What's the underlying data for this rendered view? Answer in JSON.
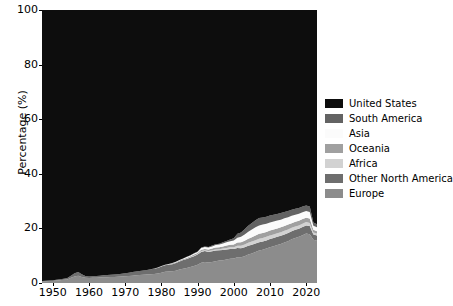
{
  "figure": {
    "background_color": "#ffffff",
    "text_color": "#000000"
  },
  "axes": {
    "ylabel": "Percentage (%)",
    "xlabel": "",
    "yticks": [
      "0",
      "20",
      "40",
      "60",
      "80",
      "100"
    ],
    "xticks": [
      "1950",
      "1960",
      "1970",
      "1980",
      "1990",
      "2000",
      "2010",
      "2020"
    ]
  },
  "legend": {
    "position": "right",
    "items": [
      {
        "label": "United States",
        "color": "#0d0d0d"
      },
      {
        "label": "South America",
        "color": "#636363"
      },
      {
        "label": "Asia",
        "color": "#fbfbfb"
      },
      {
        "label": "Oceania",
        "color": "#a0a0a0"
      },
      {
        "label": "Africa",
        "color": "#d2d2d2"
      },
      {
        "label": "Other North America",
        "color": "#6e6e6e"
      },
      {
        "label": "Europe",
        "color": "#8c8c8c"
      }
    ]
  },
  "chart_data": {
    "type": "area",
    "stacked": true,
    "title": "",
    "xlabel": "",
    "ylabel": "Percentage (%)",
    "xlim": [
      1947,
      2023
    ],
    "ylim": [
      0,
      100
    ],
    "grid": false,
    "legend_position": "right",
    "stack_order_bottom_to_top": [
      "Europe",
      "Other North America",
      "Africa",
      "Oceania",
      "Asia",
      "South America",
      "United States"
    ],
    "x": [
      1947,
      1948,
      1949,
      1950,
      1951,
      1952,
      1953,
      1954,
      1955,
      1956,
      1957,
      1958,
      1959,
      1960,
      1961,
      1962,
      1963,
      1964,
      1965,
      1966,
      1967,
      1968,
      1969,
      1970,
      1971,
      1972,
      1973,
      1974,
      1975,
      1976,
      1977,
      1978,
      1979,
      1980,
      1981,
      1982,
      1983,
      1984,
      1985,
      1986,
      1987,
      1988,
      1989,
      1990,
      1991,
      1992,
      1993,
      1994,
      1995,
      1996,
      1997,
      1998,
      1999,
      2000,
      2001,
      2002,
      2003,
      2004,
      2005,
      2006,
      2007,
      2008,
      2009,
      2010,
      2011,
      2012,
      2013,
      2014,
      2015,
      2016,
      2017,
      2018,
      2019,
      2020,
      2021,
      2022,
      2023
    ],
    "series": [
      {
        "name": "United States",
        "color": "#0d0d0d",
        "values": [
          99.3,
          99.2,
          99.1,
          99.0,
          98.8,
          98.6,
          98.4,
          98.2,
          97.3,
          96.4,
          96.0,
          96.8,
          97.4,
          97.6,
          97.5,
          97.4,
          97.3,
          97.2,
          97.1,
          97.0,
          96.9,
          96.8,
          96.6,
          96.4,
          96.2,
          96.0,
          95.8,
          95.6,
          95.4,
          95.2,
          95.0,
          94.7,
          94.3,
          93.8,
          93.3,
          93.0,
          92.7,
          92.2,
          91.6,
          91.0,
          90.4,
          89.8,
          89.1,
          88.5,
          87.0,
          86.6,
          86.8,
          86.3,
          85.8,
          85.6,
          85.1,
          84.6,
          84.1,
          83.6,
          82.0,
          81.5,
          80.3,
          79.0,
          78.0,
          77.0,
          76.2,
          76.0,
          75.7,
          75.3,
          75.0,
          74.7,
          74.4,
          74.0,
          73.6,
          73.2,
          72.8,
          72.5,
          72.0,
          71.6,
          72.0,
          77.8,
          78.5
        ]
      },
      {
        "name": "South America",
        "color": "#636363",
        "values": [
          0.0,
          0.0,
          0.0,
          0.0,
          0.0,
          0.0,
          0.0,
          0.0,
          0.0,
          0.0,
          0.0,
          0.0,
          0.0,
          0.0,
          0.0,
          0.0,
          0.0,
          0.0,
          0.0,
          0.0,
          0.0,
          0.0,
          0.0,
          0.0,
          0.0,
          0.0,
          0.0,
          0.0,
          0.0,
          0.0,
          0.0,
          0.0,
          0.0,
          0.0,
          0.0,
          0.0,
          0.0,
          0.0,
          0.0,
          0.0,
          0.1,
          0.1,
          0.1,
          0.1,
          0.2,
          0.2,
          0.2,
          0.3,
          0.3,
          0.3,
          0.4,
          0.5,
          0.6,
          0.8,
          1.4,
          1.6,
          1.9,
          2.2,
          2.4,
          2.6,
          2.7,
          2.6,
          2.6,
          2.5,
          2.5,
          2.4,
          2.4,
          2.3,
          2.3,
          2.2,
          2.2,
          2.1,
          2.1,
          2.0,
          2.0,
          1.2,
          1.1
        ]
      },
      {
        "name": "Asia",
        "color": "#fbfbfb",
        "values": [
          0.0,
          0.0,
          0.0,
          0.0,
          0.0,
          0.0,
          0.0,
          0.0,
          0.0,
          0.0,
          0.0,
          0.0,
          0.0,
          0.0,
          0.0,
          0.0,
          0.0,
          0.0,
          0.0,
          0.0,
          0.0,
          0.0,
          0.0,
          0.0,
          0.0,
          0.0,
          0.0,
          0.0,
          0.0,
          0.0,
          0.0,
          0.0,
          0.1,
          0.1,
          0.1,
          0.1,
          0.1,
          0.2,
          0.2,
          0.2,
          0.3,
          0.3,
          0.4,
          0.4,
          0.6,
          0.7,
          0.7,
          0.8,
          0.9,
          1.0,
          1.1,
          1.2,
          1.3,
          1.5,
          1.8,
          2.0,
          2.3,
          2.6,
          2.8,
          3.0,
          3.1,
          3.1,
          3.0,
          3.0,
          2.9,
          2.9,
          2.8,
          2.8,
          2.7,
          2.7,
          2.6,
          2.6,
          2.5,
          2.5,
          2.4,
          1.5,
          1.4
        ]
      },
      {
        "name": "Oceania",
        "color": "#a0a0a0",
        "values": [
          0.0,
          0.0,
          0.0,
          0.0,
          0.0,
          0.0,
          0.0,
          0.0,
          0.0,
          0.0,
          0.0,
          0.0,
          0.0,
          0.0,
          0.0,
          0.0,
          0.0,
          0.0,
          0.0,
          0.0,
          0.0,
          0.0,
          0.0,
          0.0,
          0.0,
          0.0,
          0.0,
          0.0,
          0.0,
          0.0,
          0.0,
          0.1,
          0.1,
          0.1,
          0.1,
          0.1,
          0.2,
          0.2,
          0.2,
          0.3,
          0.3,
          0.3,
          0.4,
          0.4,
          0.5,
          0.5,
          0.6,
          0.6,
          0.7,
          0.7,
          0.8,
          0.9,
          0.9,
          1.0,
          1.2,
          1.3,
          1.4,
          1.5,
          1.6,
          1.7,
          1.8,
          1.8,
          1.8,
          1.8,
          1.8,
          1.8,
          1.8,
          1.8,
          1.8,
          1.7,
          1.7,
          1.7,
          1.7,
          1.6,
          1.6,
          1.0,
          0.9
        ]
      },
      {
        "name": "Africa",
        "color": "#d2d2d2",
        "values": [
          0.0,
          0.0,
          0.0,
          0.0,
          0.0,
          0.0,
          0.0,
          0.0,
          0.0,
          0.0,
          0.0,
          0.0,
          0.0,
          0.0,
          0.0,
          0.0,
          0.0,
          0.0,
          0.0,
          0.0,
          0.0,
          0.0,
          0.0,
          0.0,
          0.0,
          0.0,
          0.0,
          0.0,
          0.0,
          0.0,
          0.0,
          0.0,
          0.0,
          0.0,
          0.0,
          0.1,
          0.1,
          0.1,
          0.1,
          0.1,
          0.1,
          0.2,
          0.2,
          0.2,
          0.3,
          0.3,
          0.3,
          0.4,
          0.4,
          0.4,
          0.5,
          0.5,
          0.6,
          0.6,
          0.8,
          0.9,
          1.0,
          1.1,
          1.2,
          1.2,
          1.3,
          1.3,
          1.3,
          1.3,
          1.3,
          1.3,
          1.3,
          1.3,
          1.3,
          1.2,
          1.2,
          1.2,
          1.2,
          1.2,
          1.1,
          0.7,
          0.7
        ]
      },
      {
        "name": "Other North America",
        "color": "#6e6e6e",
        "values": [
          0.2,
          0.2,
          0.2,
          0.3,
          0.3,
          0.4,
          0.4,
          0.5,
          0.8,
          1.2,
          1.3,
          1.0,
          0.7,
          0.6,
          0.6,
          0.7,
          0.7,
          0.7,
          0.8,
          0.8,
          0.9,
          0.9,
          1.0,
          1.1,
          1.2,
          1.3,
          1.4,
          1.5,
          1.6,
          1.7,
          1.8,
          1.9,
          2.0,
          2.2,
          2.4,
          2.5,
          2.6,
          2.8,
          3.0,
          3.2,
          3.3,
          3.4,
          3.6,
          3.7,
          4.0,
          4.0,
          3.9,
          3.9,
          3.9,
          3.8,
          3.8,
          3.7,
          3.6,
          3.5,
          3.4,
          3.3,
          3.3,
          3.2,
          3.2,
          3.1,
          3.0,
          3.0,
          3.0,
          3.0,
          3.0,
          3.0,
          3.0,
          3.0,
          3.0,
          3.0,
          3.0,
          3.0,
          3.0,
          3.0,
          3.0,
          2.0,
          1.9
        ]
      },
      {
        "name": "Europe",
        "color": "#8c8c8c",
        "values": [
          0.5,
          0.6,
          0.7,
          0.7,
          0.9,
          1.0,
          1.2,
          1.3,
          1.9,
          2.4,
          2.7,
          2.2,
          1.9,
          1.8,
          1.9,
          1.9,
          2.0,
          2.1,
          2.1,
          2.2,
          2.2,
          2.3,
          2.4,
          2.5,
          2.6,
          2.7,
          2.8,
          2.9,
          3.0,
          3.1,
          3.2,
          3.3,
          3.5,
          3.8,
          4.1,
          4.2,
          4.3,
          4.5,
          4.9,
          5.2,
          5.5,
          5.9,
          6.2,
          6.7,
          7.4,
          7.7,
          7.5,
          7.7,
          8.0,
          8.2,
          8.3,
          8.6,
          8.9,
          9.0,
          9.4,
          9.4,
          9.8,
          10.4,
          10.8,
          11.4,
          11.9,
          12.2,
          12.6,
          13.1,
          13.5,
          13.9,
          14.3,
          14.8,
          15.3,
          16.0,
          16.5,
          16.9,
          17.5,
          18.1,
          17.9,
          15.8,
          15.5
        ]
      }
    ]
  }
}
